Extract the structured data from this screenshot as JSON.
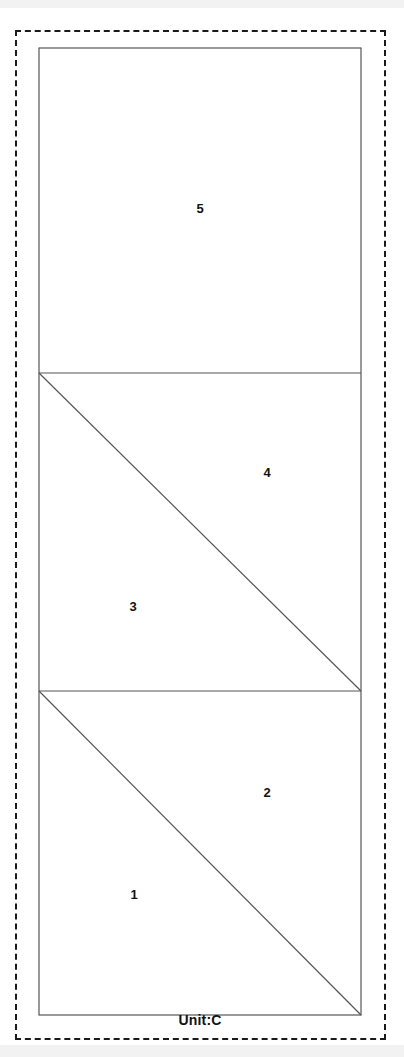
{
  "figure": {
    "caption": "Unit:C",
    "stroke_color": "#555555",
    "border_color": "#1a1a1a",
    "background_color": "#ffffff",
    "outline": {
      "x": 39,
      "y": 48,
      "width": 322,
      "height": 967
    },
    "sheet_border": {
      "x": 15,
      "y": 30,
      "width": 371,
      "height": 1010,
      "style": "dashed"
    },
    "dividers": [
      {
        "name": "divider-upper",
        "y": 373
      },
      {
        "name": "divider-lower",
        "y": 691
      }
    ],
    "cells": [
      {
        "name": "cell-top",
        "y_top": 48,
        "y_bottom": 373,
        "split": "none",
        "regions": [
          {
            "id": "5",
            "label": "5",
            "position": "center",
            "x": 200,
            "y": 208
          }
        ]
      },
      {
        "name": "cell-middle",
        "y_top": 373,
        "y_bottom": 691,
        "split": "diagonal-tl-br",
        "regions": [
          {
            "id": "3",
            "label": "3",
            "position": "lower-left",
            "x": 133,
            "y": 606
          },
          {
            "id": "4",
            "label": "4",
            "position": "upper-right",
            "x": 267,
            "y": 472
          }
        ]
      },
      {
        "name": "cell-bottom",
        "y_top": 691,
        "y_bottom": 1015,
        "split": "diagonal-tl-br",
        "regions": [
          {
            "id": "1",
            "label": "1",
            "position": "lower-left",
            "x": 134,
            "y": 894
          },
          {
            "id": "2",
            "label": "2",
            "position": "upper-right",
            "x": 267,
            "y": 792
          }
        ]
      }
    ],
    "region_labels": [
      {
        "id": "1",
        "label": "1",
        "x": 134,
        "y": 894
      },
      {
        "id": "2",
        "label": "2",
        "x": 267,
        "y": 792
      },
      {
        "id": "3",
        "label": "3",
        "x": 133,
        "y": 606
      },
      {
        "id": "4",
        "label": "4",
        "x": 267,
        "y": 472
      },
      {
        "id": "5",
        "label": "5",
        "x": 200,
        "y": 208
      }
    ]
  }
}
